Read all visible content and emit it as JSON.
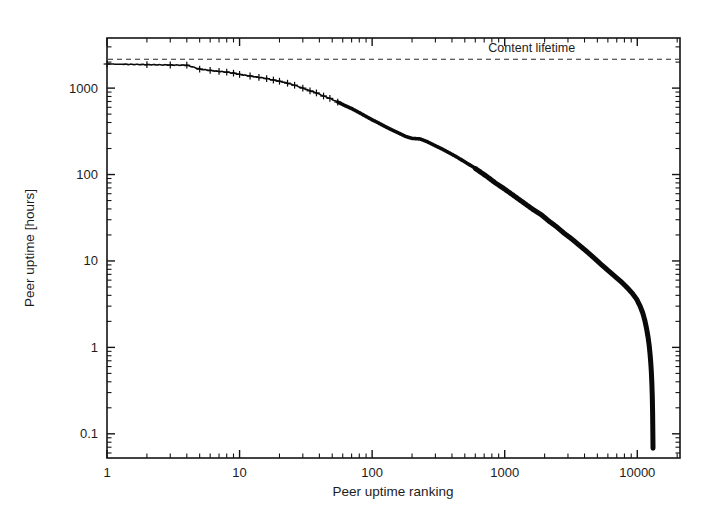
{
  "figure": {
    "background": "#ffffff",
    "ink": "#0a0a0a"
  },
  "axis": {
    "x_title": "Peer uptime ranking",
    "y_title": "Peer uptime [hours]",
    "x_ticks": [
      "1",
      "10",
      "100",
      "1000",
      "10000"
    ],
    "y_ticks": [
      "1000",
      "100",
      "10",
      "1",
      "0.1"
    ]
  },
  "annotations": {
    "content_lifetime": "Content lifetime"
  },
  "chart_data": {
    "type": "line",
    "title": "",
    "xlabel": "Peer uptime ranking",
    "ylabel": "Peer uptime [hours]",
    "xscale": "log",
    "yscale": "log",
    "xlim": [
      1,
      21000
    ],
    "ylim": [
      0.0525,
      3800
    ],
    "grid": false,
    "legend": "none",
    "x_tick_values": [
      1,
      10,
      100,
      1000,
      10000
    ],
    "x_tick_labels": [
      "1",
      "10",
      "100",
      "1000",
      "10000"
    ],
    "y_tick_values": [
      1000,
      100,
      10,
      1,
      0.1
    ],
    "y_tick_labels": [
      "1000",
      "100",
      "10",
      "1",
      "0.1"
    ],
    "annotations": [
      {
        "text": "Content lifetime",
        "type": "hline",
        "y": 2160,
        "label_x": 1600,
        "style": "dashed"
      }
    ],
    "series": [
      {
        "name": "Peer uptime",
        "marker": "plus",
        "marker_until_rank": 55,
        "x": [
          1,
          2,
          3,
          4,
          5,
          6,
          7,
          8,
          9,
          10,
          12,
          14,
          16,
          18,
          20,
          23,
          26,
          30,
          34,
          38,
          43,
          48,
          55,
          62,
          70,
          80,
          90,
          100,
          110,
          125,
          140,
          160,
          180,
          200,
          230,
          260,
          300,
          340,
          390,
          440,
          500,
          570,
          650,
          740,
          850,
          970,
          1100,
          1250,
          1450,
          1650,
          1900,
          2150,
          2450,
          2800,
          3200,
          3650,
          4150,
          4700,
          5300,
          6000,
          6800,
          7600,
          8400,
          9200,
          9900,
          10500,
          11000,
          11400,
          11750,
          12050,
          12300,
          12500,
          12680,
          12820,
          12930,
          13010,
          13070,
          13110,
          13140
        ],
        "y": [
          1900,
          1870,
          1850,
          1840,
          1660,
          1600,
          1560,
          1530,
          1490,
          1440,
          1380,
          1330,
          1290,
          1240,
          1200,
          1140,
          1080,
          1000,
          930,
          880,
          810,
          760,
          690,
          630,
          580,
          520,
          470,
          430,
          400,
          360,
          330,
          300,
          275,
          262,
          258,
          240,
          215,
          196,
          175,
          158,
          140,
          124,
          108,
          94,
          80,
          70,
          61,
          53,
          45,
          39,
          34,
          29,
          25,
          21,
          18,
          15.2,
          12.9,
          10.9,
          9.2,
          7.8,
          6.6,
          5.7,
          4.9,
          4.2,
          3.6,
          3.0,
          2.5,
          2.05,
          1.65,
          1.32,
          1.05,
          0.82,
          0.62,
          0.46,
          0.33,
          0.23,
          0.155,
          0.105,
          0.068
        ]
      }
    ]
  }
}
